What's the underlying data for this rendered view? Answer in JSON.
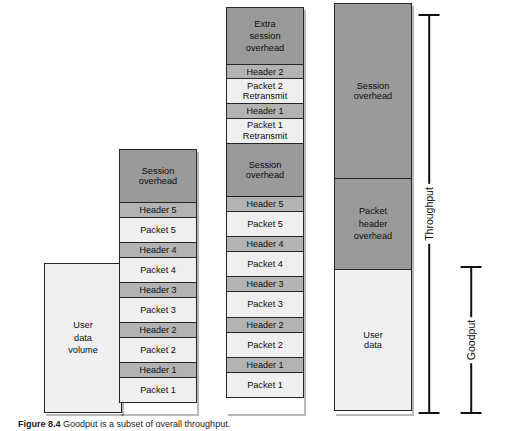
{
  "figure": {
    "caption_number": "Figure 8.4",
    "caption_text": "Goodput is a subset of overall throughput.",
    "colors": {
      "session_overhead": "#9a9a9a",
      "header": "#b3b3b3",
      "packet": "#efefef",
      "user_data": "#f0f0f0",
      "outline": "#262626"
    }
  },
  "columns": [
    {
      "id": "col1",
      "name": "user-data-volume-column",
      "blocks": [
        {
          "label": "User\ndata\nvolume",
          "shade": "pale",
          "height": 150
        }
      ]
    },
    {
      "id": "col2",
      "name": "ideal-transmission-column",
      "blocks": [
        {
          "label": "Session\noverhead",
          "shade": "dark",
          "height": 54
        },
        {
          "label": "Header 5",
          "shade": "mid",
          "height": 16
        },
        {
          "label": "Packet 5",
          "shade": "light",
          "height": 26
        },
        {
          "label": "Header 4",
          "shade": "mid",
          "height": 16
        },
        {
          "label": "Packet 4",
          "shade": "light",
          "height": 26
        },
        {
          "label": "Header 3",
          "shade": "mid",
          "height": 16
        },
        {
          "label": "Packet 3",
          "shade": "light",
          "height": 26
        },
        {
          "label": "Header 2",
          "shade": "mid",
          "height": 16
        },
        {
          "label": "Packet 2",
          "shade": "light",
          "height": 26
        },
        {
          "label": "Header 1",
          "shade": "mid",
          "height": 16
        },
        {
          "label": "Packet 1",
          "shade": "light",
          "height": 26
        }
      ]
    },
    {
      "id": "col3",
      "name": "retransmission-column",
      "blocks": [
        {
          "label": "Extra\nsession\noverhead",
          "shade": "dark",
          "height": 58
        },
        {
          "label": "Header 2",
          "shade": "mid",
          "height": 15
        },
        {
          "label": "Packet 2\nRetransmit",
          "shade": "light",
          "height": 26
        },
        {
          "label": "Header 1",
          "shade": "mid",
          "height": 15
        },
        {
          "label": "Packet 1\nRetransmit",
          "shade": "light",
          "height": 26
        },
        {
          "label": "Session\noverhead",
          "shade": "dark",
          "height": 54
        },
        {
          "label": "Header 5",
          "shade": "mid",
          "height": 16
        },
        {
          "label": "Packet 5",
          "shade": "light",
          "height": 26
        },
        {
          "label": "Header 4",
          "shade": "mid",
          "height": 16
        },
        {
          "label": "Packet 4",
          "shade": "light",
          "height": 26
        },
        {
          "label": "Header 3",
          "shade": "mid",
          "height": 16
        },
        {
          "label": "Packet 3",
          "shade": "light",
          "height": 26
        },
        {
          "label": "Header 2",
          "shade": "mid",
          "height": 16
        },
        {
          "label": "Packet 2",
          "shade": "light",
          "height": 26
        },
        {
          "label": "Header 1",
          "shade": "mid",
          "height": 16
        },
        {
          "label": "Packet 1",
          "shade": "light",
          "height": 26
        }
      ]
    },
    {
      "id": "col4",
      "name": "aggregate-column",
      "blocks": [
        {
          "label": "Session\noverhead",
          "shade": "dark",
          "height": 176
        },
        {
          "label": "Packet\nheader\noverhead",
          "shade": "dark",
          "height": 92
        },
        {
          "label": "User\ndata",
          "shade": "pale",
          "height": 142
        }
      ]
    }
  ],
  "brackets": [
    {
      "id": "throughput",
      "name": "throughput-bracket",
      "label": "Throughput"
    },
    {
      "id": "goodput",
      "name": "goodput-bracket",
      "label": "Goodput"
    }
  ]
}
